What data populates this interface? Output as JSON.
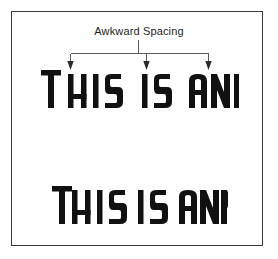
{
  "figure": {
    "kind": "typography-specimen",
    "background_color": "#ffffff",
    "frame_color": "#3a3a3a",
    "ink_color": "#111111",
    "leader_color": "#5a5a5a"
  },
  "annotation": {
    "label": "Awkward Spacing",
    "arrow_count": 3,
    "text_color": "#1d1d1d"
  },
  "specimen": {
    "top_line": {
      "text": "THIS IS ANNA",
      "caption": "loose, uneven letterspacing",
      "letters": [
        "T",
        "H",
        "I",
        "S",
        " ",
        "I",
        "S",
        " ",
        "A",
        "N",
        "N",
        "A"
      ]
    },
    "bottom_line": {
      "text": "THIS IS ANNA",
      "caption": "corrected, even letterspacing",
      "letters": [
        "T",
        "H",
        "I",
        "S",
        " ",
        "I",
        "S",
        " ",
        "A",
        "N",
        "N",
        "A"
      ]
    }
  }
}
